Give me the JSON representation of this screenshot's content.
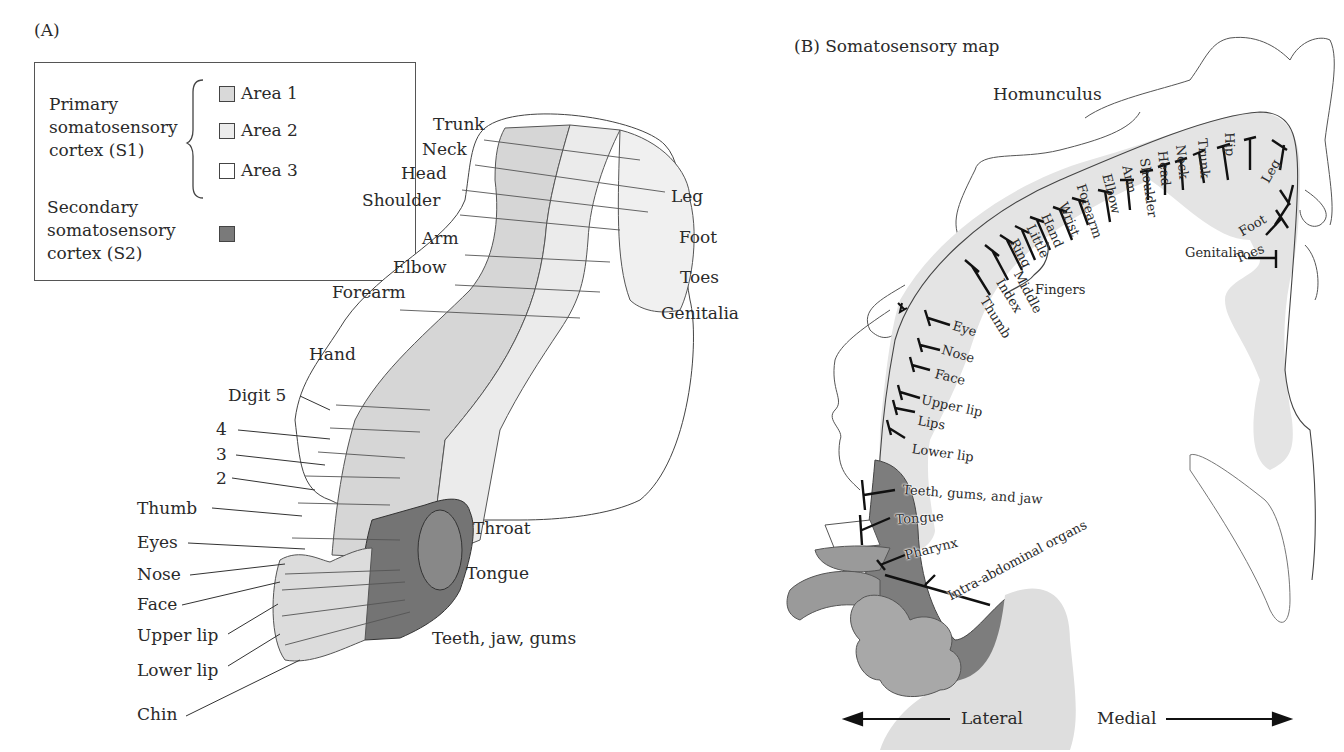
{
  "panel_a": {
    "title": "(A)",
    "legend": {
      "primary_label_lines": [
        "Primary",
        "somatosensory",
        "cortex (S1)"
      ],
      "secondary_label_lines": [
        "Secondary",
        "somatosensory",
        "cortex (S2)"
      ],
      "areas": [
        {
          "label": "Area 1",
          "color": "#d9d9d9"
        },
        {
          "label": "Area 2",
          "color": "#ececec"
        },
        {
          "label": "Area 3",
          "color": "#ffffff"
        }
      ],
      "s2_color": "#7a7a7a"
    },
    "left_labels": [
      "Trunk",
      "Neck",
      "Head",
      "Shoulder",
      "Arm",
      "Elbow",
      "Forearm",
      "Hand",
      "Digit 5",
      "4",
      "3",
      "2",
      "Thumb",
      "Eyes",
      "Nose",
      "Face",
      "Upper lip",
      "Lower lip",
      "Chin"
    ],
    "right_labels": [
      "Leg",
      "Foot",
      "Toes",
      "Genitalia",
      "Throat",
      "Tongue",
      "Teeth, jaw, gums"
    ]
  },
  "panel_b": {
    "title": "(B)  Somatosensory map",
    "homunculus_label": "Homunculus",
    "upper_body_labels": [
      "Thumb",
      "Index",
      "Middle",
      "Ring",
      "Little",
      "Hand",
      "Wrist",
      "Forearm",
      "Elbow",
      "Arm",
      "Shoulder",
      "Head",
      "Neck",
      "Trunk",
      "Hip",
      "Leg",
      "Foot",
      "Toes",
      "Genitalia"
    ],
    "fingers_label": "Fingers",
    "face_labels": [
      "Eye",
      "Nose",
      "Face",
      "Upper lip",
      "Lips",
      "Lower lip"
    ],
    "s2_labels": [
      "Teeth, gums, and jaw",
      "Tongue",
      "Pharynx",
      "Intra-abdominal organs"
    ],
    "axis": {
      "left": "Lateral",
      "right": "Medial"
    }
  }
}
